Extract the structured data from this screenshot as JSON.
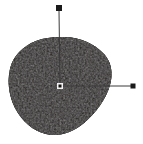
{
  "canvas": {
    "width": 143,
    "height": 144,
    "background_color": "#ffffff",
    "label": "shape-annotation-canvas"
  },
  "blob": {
    "name": "dark-blob-region",
    "fill_color": "#14110f",
    "edge_color": "#241f1c",
    "texture_color": "#2b2522",
    "description": "dark egg shaped region",
    "bounds": {
      "x": 8,
      "y": 36,
      "width": 104,
      "height": 100
    },
    "path": "M 60 37 C 78 36 94 43 104 54 C 112 63 113 74 110 85 C 106 99 96 113 84 123 C 72 133 58 137 46 134 C 33 131 22 121 15 108 C 9 96 7 82 10 69 C 13 56 23 46 36 41 C 44 38 52 37 60 37 Z"
  },
  "markers": {
    "centroid": {
      "name": "centroid-marker",
      "shape": "hollow-square",
      "x": 60,
      "y": 86,
      "size": 6,
      "stroke_color": "#f2f2f2",
      "fill_color": "#14110f"
    },
    "major_axis_end": {
      "name": "major-axis-endpoint-marker",
      "shape": "filled-square",
      "x": 59,
      "y": 8,
      "size": 6,
      "fill_color": "#1a1a1a"
    },
    "minor_axis_end": {
      "name": "minor-axis-endpoint-marker",
      "shape": "filled-square",
      "x": 133,
      "y": 86,
      "size": 5,
      "fill_color": "#1a1a1a"
    }
  },
  "axis_lines": {
    "vertical": {
      "name": "vertical-axis-line",
      "x1": 59,
      "y1": 11,
      "x2": 60,
      "y2": 86,
      "color": "#3a3a3a",
      "width": 1
    },
    "horizontal": {
      "name": "horizontal-axis-line",
      "x1": 60,
      "y1": 86,
      "x2": 131,
      "y2": 86,
      "color": "#3a3a3a",
      "width": 1
    }
  }
}
